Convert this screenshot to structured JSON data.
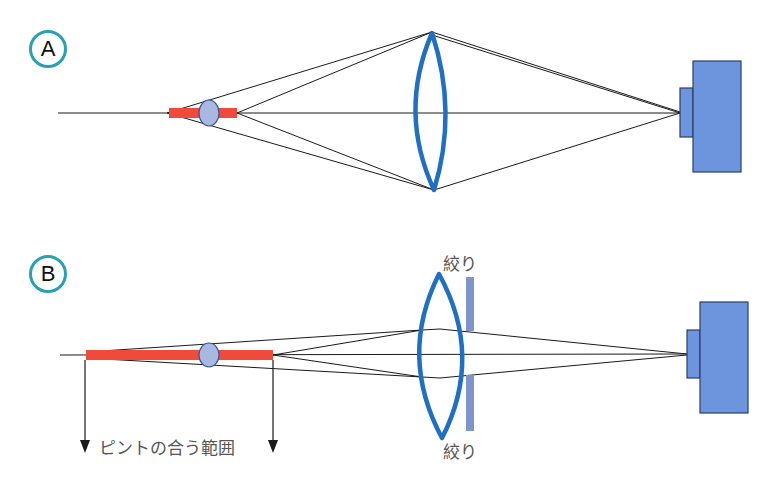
{
  "panels": [
    {
      "id": "A",
      "label": "A"
    },
    {
      "id": "B",
      "label": "B"
    }
  ],
  "labels": {
    "aperture_top": "絞り",
    "aperture_bottom": "絞り",
    "depth_of_field": "ピントの合う範囲"
  },
  "colors": {
    "lens": "#1f6fc4",
    "subject_zone": "#f04a3a",
    "subject": "#a9b8e0",
    "camera": "#6d95dd",
    "aperture": "#7f93cc",
    "panel_circle": "#2aa0b5",
    "rays": "#1a1a1a"
  },
  "icons": {
    "camera": "camera-icon",
    "lens": "convex-lens-icon",
    "aperture": "aperture-icon",
    "arrow": "arrow-down-icon"
  }
}
